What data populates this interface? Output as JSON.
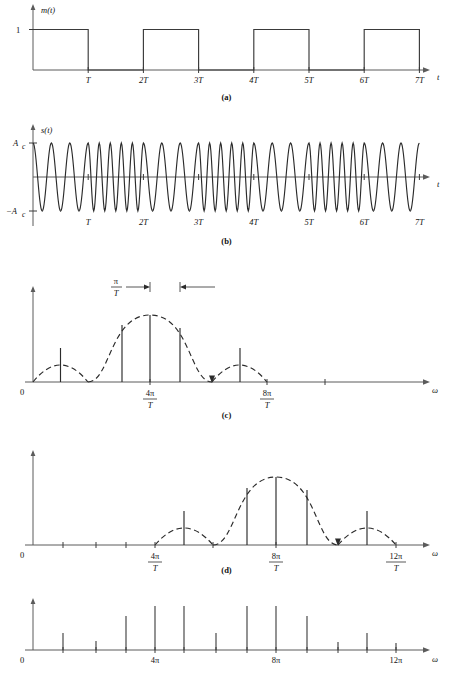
{
  "figure": {
    "domain": "signal-processing-figure"
  },
  "panels": [
    {
      "id": "a",
      "caption": "(a)",
      "ylabel": "m(t)",
      "xlabel": "t",
      "ytick_label": "1",
      "xtick_labels": [
        "T",
        "2T",
        "3T",
        "4T",
        "5T",
        "6T",
        "7T"
      ],
      "type": "square-wave",
      "bits": [
        1,
        0,
        1,
        0,
        1,
        0,
        1
      ]
    },
    {
      "id": "b",
      "caption": "(b)",
      "ylabel": "s(t)",
      "xlabel": "t",
      "ytick_labels": [
        "A_c",
        "-A_c"
      ],
      "ytop_label": "A",
      "ytop_sub": "c",
      "ybot_label": "−A",
      "ybot_sub": "c",
      "xtick_labels": [
        "T",
        "2T",
        "3T",
        "4T",
        "5T",
        "6T",
        "7T"
      ],
      "type": "fsk-waveform",
      "cycles_per_interval": [
        3,
        5,
        3,
        5,
        3,
        5,
        3
      ]
    },
    {
      "id": "c",
      "caption": "(c)",
      "xlabel": "ω",
      "origin_label": "0",
      "xtick_labels": [
        "4π/T",
        "8π/T"
      ],
      "annotation_label": "π/T",
      "type": "spectrum-lowfreq",
      "center": "4π/T"
    },
    {
      "id": "d",
      "caption": "(d)",
      "xlabel": "ω",
      "origin_label": "0",
      "xtick_labels": [
        "4π/T",
        "8π/T",
        "12π/T"
      ],
      "type": "spectrum-highfreq",
      "center": "8π/T"
    },
    {
      "id": "e",
      "caption": "",
      "xlabel": "ω",
      "origin_label": "0",
      "xtick_labels": [
        "4π",
        "8π",
        "12π"
      ],
      "type": "composite-line-spectrum"
    }
  ],
  "chart_data": [
    {
      "type": "line",
      "panel": "a",
      "title": "m(t) binary message signal",
      "xlabel": "t",
      "ylabel": "m(t)",
      "x": [
        0,
        1,
        2,
        3,
        4,
        5,
        6,
        7
      ],
      "values": [
        1,
        0,
        1,
        0,
        1,
        0,
        1
      ],
      "xticklabels": [
        "T",
        "2T",
        "3T",
        "4T",
        "5T",
        "6T",
        "7T"
      ],
      "yticklabels": [
        "1"
      ],
      "ylim": [
        0,
        1.25
      ],
      "grid": false,
      "legend": "none"
    },
    {
      "type": "line",
      "panel": "b",
      "title": "s(t) FSK modulated carrier",
      "xlabel": "t",
      "ylabel": "s(t)",
      "xticklabels": [
        "T",
        "2T",
        "3T",
        "4T",
        "5T",
        "6T",
        "7T"
      ],
      "yticklabels": [
        "A_c",
        "-A_c"
      ],
      "ylim": [
        -1,
        1
      ],
      "series": [
        {
          "name": "s(t)",
          "cycles_per_symbol": [
            3,
            5,
            3,
            5,
            3,
            5,
            3
          ]
        }
      ],
      "grid": false,
      "legend": "none"
    },
    {
      "type": "bar",
      "panel": "c",
      "title": "Spectrum of lower-frequency tone (centered 4π/T)",
      "xlabel": "ω",
      "ylabel": "",
      "envelope": "sinc-magnitude lobes",
      "center_omega": "4π/T",
      "lobe_width": "π/T spacing between lines",
      "categories": [
        "l1",
        "l2",
        "l3",
        "l4",
        "l5"
      ],
      "values": [
        0.3,
        0.72,
        1.0,
        0.68,
        0.3
      ],
      "xticklabels": [
        "4π/T",
        "8π/T"
      ],
      "ylim": [
        0,
        1.1
      ],
      "grid": false,
      "legend": "none"
    },
    {
      "type": "bar",
      "panel": "d",
      "title": "Spectrum of upper-frequency tone (centered 8π/T)",
      "xlabel": "ω",
      "ylabel": "",
      "envelope": "sinc-magnitude lobes",
      "center_omega": "8π/T",
      "categories": [
        "l1",
        "l2",
        "l3",
        "l4",
        "l5"
      ],
      "values": [
        0.3,
        0.72,
        1.0,
        0.68,
        0.3
      ],
      "xticklabels": [
        "4π/T",
        "8π/T",
        "12π/T"
      ],
      "ylim": [
        0,
        1.1
      ],
      "grid": false,
      "legend": "none"
    },
    {
      "type": "bar",
      "panel": "e",
      "title": "Composite FSK line spectrum",
      "xlabel": "ω",
      "ylabel": "",
      "categories": [
        "1",
        "2",
        "3",
        "4",
        "5",
        "6",
        "7",
        "8",
        "9",
        "10",
        "11",
        "12",
        "13",
        "14"
      ],
      "values": [
        0.3,
        0.14,
        0.62,
        0.88,
        0.88,
        0.3,
        0.88,
        0.88,
        0.62,
        0.14,
        0.3,
        0.1
      ],
      "xticklabels": [
        "4π",
        "8π",
        "12π"
      ],
      "ylim": [
        0,
        1.0
      ],
      "grid": false,
      "legend": "none"
    }
  ]
}
